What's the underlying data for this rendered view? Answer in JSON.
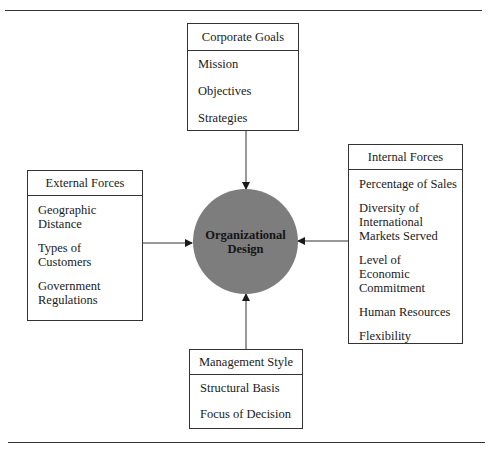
{
  "diagram": {
    "center": {
      "label_line1": "Organizational",
      "label_line2": "Design",
      "fill": "#7d7d7d"
    },
    "boxes": {
      "corporate_goals": {
        "title": "Corporate Goals",
        "items": [
          "Mission",
          "Objectives",
          "Strategies"
        ]
      },
      "external_forces": {
        "title": "External Forces",
        "items": [
          "Geographic Distance",
          "Types of Customers",
          "Government Regulations"
        ]
      },
      "internal_forces": {
        "title": "Internal Forces",
        "items": [
          "Percentage of Sales",
          "Diversity of International Markets Served",
          "Level of Economic Commitment",
          "Human Resources",
          "Flexibility"
        ]
      },
      "management_style": {
        "title": "Management Style",
        "items": [
          "Structural Basis",
          "Focus of Decision"
        ]
      }
    },
    "arrows": [
      {
        "from": "Corporate Goals",
        "to": "Organizational Design"
      },
      {
        "from": "External Forces",
        "to": "Organizational Design"
      },
      {
        "from": "Internal Forces",
        "to": "Organizational Design"
      },
      {
        "from": "Management Style",
        "to": "Organizational Design"
      }
    ]
  }
}
